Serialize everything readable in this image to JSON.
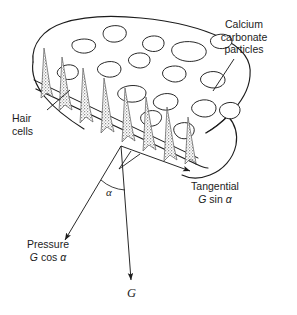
{
  "figure": {
    "background_color": "#ffffff",
    "ink_color": "#1c1c1c",
    "hair_cell_fill": "#8e8e8e"
  },
  "labels": {
    "calcium_line1": "Calcium",
    "calcium_line2": "carbonate",
    "calcium_line3": "particles",
    "hair_line1": "Hair",
    "hair_line2": "cells",
    "tangential_line1": "Tangential",
    "tangential_symbol_italic": "G",
    "tangential_symbol_rest": " sin",
    "tangential_angle": "α",
    "pressure_line1": "Pressure",
    "pressure_symbol_italic": "G",
    "pressure_symbol_rest": " cos",
    "pressure_angle": "α",
    "gravity_symbol": "G",
    "angle_symbol": "α"
  },
  "vectors": [
    {
      "name": "gravity",
      "label": "G",
      "direction": "down",
      "origin": [
        121,
        146
      ],
      "tip": [
        131,
        283
      ]
    },
    {
      "name": "pressure",
      "label": "Pressure G cos α",
      "direction": "down-left",
      "origin": [
        121,
        146
      ],
      "tip": [
        62,
        243
      ]
    },
    {
      "name": "tangential",
      "label": "Tangential G sin α",
      "direction": "down-right",
      "origin": [
        121,
        146
      ],
      "tip": [
        193,
        173
      ]
    }
  ],
  "annotations": {
    "angle_between": "alpha between gravity vector and pressure vector",
    "particle_count": 16,
    "hair_cell_count": 8
  }
}
